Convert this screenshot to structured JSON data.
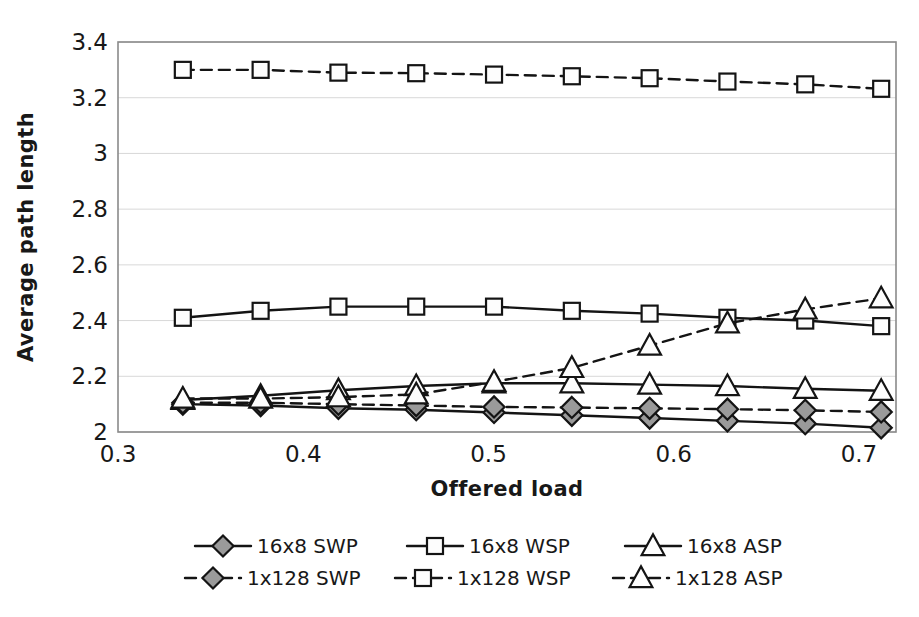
{
  "chart_data": {
    "type": "line",
    "title": "",
    "xlabel": "Offered load",
    "ylabel": "Average path length",
    "xlim": [
      0.3,
      0.72
    ],
    "ylim": [
      2,
      3.4
    ],
    "xticks": [
      "0.3",
      "0.4",
      "0.5",
      "0.6",
      "0.7"
    ],
    "xtick_values": [
      0.3,
      0.4,
      0.5,
      0.6,
      0.7
    ],
    "yticks": [
      "2",
      "2.2",
      "2.4",
      "2.6",
      "2.8",
      "3",
      "3.2",
      "3.4"
    ],
    "ytick_values": [
      2,
      2.2,
      2.4,
      2.6,
      2.8,
      3,
      3.2,
      3.4
    ],
    "grid": "horizontal",
    "legend_position": "bottom",
    "x": [
      0.335,
      0.377,
      0.419,
      0.461,
      0.503,
      0.545,
      0.587,
      0.629,
      0.671,
      0.712
    ],
    "series": [
      {
        "name": "16x8 SWP",
        "marker": "diamond",
        "fill": "shaded",
        "dash": false,
        "values": [
          2.1,
          2.095,
          2.085,
          2.08,
          2.07,
          2.06,
          2.05,
          2.04,
          2.03,
          2.015
        ]
      },
      {
        "name": "16x8 WSP",
        "marker": "square",
        "fill": "hollow",
        "dash": false,
        "values": [
          2.41,
          2.435,
          2.45,
          2.45,
          2.45,
          2.435,
          2.425,
          2.41,
          2.4,
          2.38
        ]
      },
      {
        "name": "16x8 ASP",
        "marker": "triangle",
        "fill": "hollow",
        "dash": false,
        "values": [
          2.115,
          2.13,
          2.15,
          2.165,
          2.175,
          2.175,
          2.17,
          2.165,
          2.155,
          2.148
        ]
      },
      {
        "name": "1x128 SWP",
        "marker": "diamond",
        "fill": "shaded",
        "dash": true,
        "values": [
          2.105,
          2.105,
          2.1,
          2.095,
          2.09,
          2.088,
          2.085,
          2.082,
          2.078,
          2.072
        ]
      },
      {
        "name": "1x128 WSP",
        "marker": "square",
        "fill": "hollow",
        "dash": true,
        "values": [
          3.3,
          3.3,
          3.29,
          3.288,
          3.283,
          3.277,
          3.27,
          3.258,
          3.248,
          3.232
        ]
      },
      {
        "name": "1x128 ASP",
        "marker": "triangle",
        "fill": "hollow",
        "dash": true,
        "values": [
          2.12,
          2.12,
          2.125,
          2.135,
          2.18,
          2.23,
          2.31,
          2.39,
          2.44,
          2.48
        ]
      }
    ]
  },
  "legend": {
    "rows": [
      [
        {
          "label": "16x8 SWP",
          "marker": "diamond",
          "fill": "shaded",
          "dash": false
        },
        {
          "label": "16x8 WSP",
          "marker": "square",
          "fill": "hollow",
          "dash": false
        },
        {
          "label": "16x8 ASP",
          "marker": "triangle",
          "fill": "hollow",
          "dash": false
        }
      ],
      [
        {
          "label": "1x128 SWP",
          "marker": "diamond",
          "fill": "shaded",
          "dash": true
        },
        {
          "label": "1x128 WSP",
          "marker": "square",
          "fill": "hollow",
          "dash": true
        },
        {
          "label": "1x128 ASP",
          "marker": "triangle",
          "fill": "hollow",
          "dash": true
        }
      ]
    ]
  },
  "colors": {
    "line": "#141414",
    "grid": "#d8d8d8",
    "border": "#8a8a8a",
    "text": "#181818",
    "marker_shaded": "#9a9a9a",
    "marker_hollow": "#fdfdfd"
  }
}
